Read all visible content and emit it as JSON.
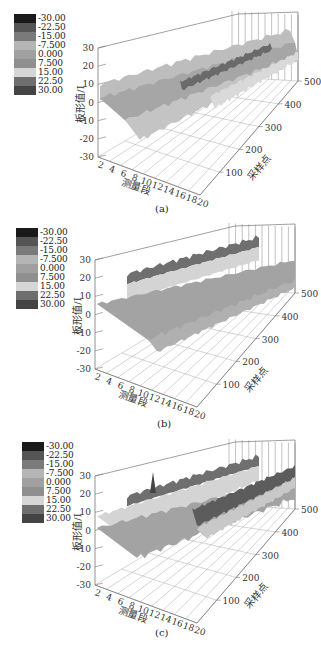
{
  "legend": {
    "levels": [
      "-30.00",
      "-22.50",
      "-15.00",
      "-7.500",
      "0.000",
      "7.500",
      "15.00",
      "22.50",
      "30.00"
    ],
    "colors": [
      "#1a1a1a",
      "#555555",
      "#7a7a7a",
      "#b5b5b5",
      "#a0a0a0",
      "#8f8f8f",
      "#d6d6d6",
      "#6e6e6e",
      "#444444"
    ]
  },
  "axes": {
    "z_label": "板形值/I",
    "x_label": "测量段",
    "y_label": "采样点",
    "z_ticks": [
      "30",
      "20",
      "10",
      "0",
      "-10",
      "-20",
      "-30"
    ],
    "x_ticks": [
      "2",
      "4",
      "6",
      "8",
      "10",
      "12",
      "14",
      "16",
      "18",
      "20"
    ],
    "y_ticks": [
      "100",
      "200",
      "300",
      "400",
      "500"
    ]
  },
  "panels": [
    {
      "caption": "(a)"
    },
    {
      "caption": "(b)"
    },
    {
      "caption": "(c)"
    }
  ],
  "chart_data": [
    {
      "type": "surface3d",
      "title": "(a)",
      "xlabel": "测量段",
      "ylabel": "采样点",
      "zlabel": "板形值/I",
      "x_range": [
        2,
        20
      ],
      "y_range": [
        0,
        500
      ],
      "z_range": [
        -30,
        30
      ],
      "x_ticks": [
        2,
        4,
        6,
        8,
        10,
        12,
        14,
        16,
        18,
        20
      ],
      "y_ticks": [
        100,
        200,
        300,
        400,
        500
      ],
      "z_ticks": [
        -30,
        -20,
        -10,
        0,
        10,
        20,
        30
      ],
      "colorbar_levels": [
        -30,
        -22.5,
        -15,
        -7.5,
        0,
        7.5,
        15,
        22.5,
        30
      ],
      "description": "Flatness surface roughly between -15 and 15 I; edges near 5-10, dip to about -15 near segment 6-8; darker higher values (~15-20) along middle-right segments"
    },
    {
      "type": "surface3d",
      "title": "(b)",
      "xlabel": "测量段",
      "ylabel": "采样点",
      "zlabel": "板形值/I",
      "x_range": [
        2,
        20
      ],
      "y_range": [
        0,
        500
      ],
      "z_range": [
        -30,
        30
      ],
      "x_ticks": [
        2,
        4,
        6,
        8,
        10,
        12,
        14,
        16,
        18,
        20
      ],
      "y_ticks": [
        100,
        200,
        300,
        400,
        500
      ],
      "z_ticks": [
        -30,
        -20,
        -10,
        0,
        10,
        20,
        30
      ],
      "colorbar_levels": [
        -30,
        -22.5,
        -15,
        -7.5,
        0,
        7.5,
        15,
        22.5,
        30
      ],
      "description": "Surface mostly 0-10 I with a ridge band of ~15-25 I near segments 8-10 along all sampling points; dips to about -15 at segments 4-8"
    },
    {
      "type": "surface3d",
      "title": "(c)",
      "xlabel": "测量段",
      "ylabel": "采样点",
      "zlabel": "板形值/I",
      "x_range": [
        2,
        20
      ],
      "y_range": [
        0,
        500
      ],
      "z_range": [
        -30,
        30
      ],
      "x_ticks": [
        2,
        4,
        6,
        8,
        10,
        12,
        14,
        16,
        18,
        20
      ],
      "y_ticks": [
        100,
        200,
        300,
        400,
        500
      ],
      "z_ticks": [
        -30,
        -20,
        -10,
        0,
        10,
        20,
        30
      ],
      "colorbar_levels": [
        -30,
        -22.5,
        -15,
        -7.5,
        0,
        7.5,
        15,
        22.5,
        30
      ],
      "description": "Surface with values from about -15 to 25 I; a spike near 25 at segment ~8 and a dark high band (~20) along segments 14-18 at later sampling points"
    }
  ]
}
